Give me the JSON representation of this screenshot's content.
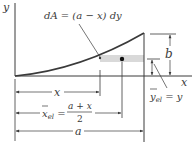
{
  "diagram": {
    "type": "area-element-centroid-figure",
    "axes": {
      "x_label": "x",
      "y_label": "y"
    },
    "element_label": "dA = (a − x) dy",
    "dimensions": {
      "x_label": "x",
      "xel_label_lhs": "x̄el =",
      "xel_numerator": "a + x",
      "xel_denominator": "2",
      "a_label": "a",
      "b_label": "b",
      "yel_label": "ȳel = y"
    },
    "colors": {
      "line": "#3a3a3a",
      "strip_fill": "#d9d9d9",
      "dot": "#111111"
    }
  }
}
